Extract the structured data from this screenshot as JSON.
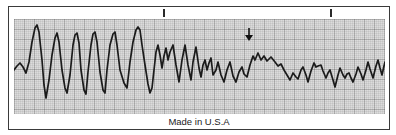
{
  "figure": {
    "type": "ecg-rhythm-strip",
    "caption": "Made in U.S.A",
    "colors": {
      "paper": "#ffffff",
      "frame_border": "#3a3a3a",
      "grid_bg": "#dcdcdc",
      "grid_minor": "rgba(0,0,0,0.06)",
      "grid_major": "rgba(0,0,0,0.16)",
      "trace": "#1b1b1b",
      "annotation": "#111111"
    }
  },
  "chart_data": {
    "type": "line",
    "title": "",
    "xlabel": "",
    "ylabel": "",
    "legend": false,
    "grid": true,
    "series_name": "ecg-trace",
    "grid_origin": [
      14,
      19
    ],
    "grid_size": [
      371,
      95
    ],
    "minor_cell_px": 2,
    "major_cell_px": 10,
    "points": [
      [
        14,
        70
      ],
      [
        17,
        66
      ],
      [
        20,
        63
      ],
      [
        23,
        67
      ],
      [
        26,
        73
      ],
      [
        29,
        62
      ],
      [
        32,
        42
      ],
      [
        35,
        28
      ],
      [
        37,
        25
      ],
      [
        39,
        32
      ],
      [
        42,
        60
      ],
      [
        44,
        85
      ],
      [
        46,
        98
      ],
      [
        49,
        80
      ],
      [
        52,
        55
      ],
      [
        55,
        38
      ],
      [
        57,
        33
      ],
      [
        59,
        42
      ],
      [
        62,
        70
      ],
      [
        65,
        88
      ],
      [
        67,
        93
      ],
      [
        70,
        75
      ],
      [
        73,
        45
      ],
      [
        75,
        35
      ],
      [
        77,
        33
      ],
      [
        79,
        43
      ],
      [
        81,
        70
      ],
      [
        84,
        90
      ],
      [
        86,
        94
      ],
      [
        88,
        72
      ],
      [
        91,
        45
      ],
      [
        93,
        34
      ],
      [
        95,
        32
      ],
      [
        97,
        42
      ],
      [
        100,
        72
      ],
      [
        103,
        90
      ],
      [
        105,
        93
      ],
      [
        107,
        70
      ],
      [
        110,
        45
      ],
      [
        113,
        34
      ],
      [
        115,
        32
      ],
      [
        117,
        45
      ],
      [
        120,
        70
      ],
      [
        124,
        83
      ],
      [
        127,
        88
      ],
      [
        130,
        62
      ],
      [
        133,
        42
      ],
      [
        136,
        30
      ],
      [
        138,
        27
      ],
      [
        140,
        30
      ],
      [
        142,
        45
      ],
      [
        145,
        65
      ],
      [
        148,
        84
      ],
      [
        150,
        93
      ],
      [
        152,
        88
      ],
      [
        154,
        70
      ],
      [
        156,
        52
      ],
      [
        158,
        45
      ],
      [
        160,
        55
      ],
      [
        162,
        68
      ],
      [
        164,
        56
      ],
      [
        166,
        48
      ],
      [
        168,
        60
      ],
      [
        170,
        52
      ],
      [
        173,
        45
      ],
      [
        176,
        65
      ],
      [
        179,
        82
      ],
      [
        182,
        60
      ],
      [
        185,
        45
      ],
      [
        188,
        65
      ],
      [
        191,
        80
      ],
      [
        193,
        62
      ],
      [
        196,
        47
      ],
      [
        199,
        68
      ],
      [
        201,
        77
      ],
      [
        203,
        65
      ],
      [
        205,
        60
      ],
      [
        207,
        70
      ],
      [
        209,
        63
      ],
      [
        211,
        58
      ],
      [
        213,
        75
      ],
      [
        216,
        70
      ],
      [
        218,
        62
      ],
      [
        221,
        75
      ],
      [
        224,
        82
      ],
      [
        227,
        70
      ],
      [
        230,
        62
      ],
      [
        233,
        76
      ],
      [
        236,
        82
      ],
      [
        239,
        72
      ],
      [
        242,
        67
      ],
      [
        244,
        74
      ],
      [
        247,
        77
      ],
      [
        250,
        65
      ],
      [
        253,
        56
      ],
      [
        255,
        60
      ],
      [
        258,
        53
      ],
      [
        261,
        60
      ],
      [
        264,
        56
      ],
      [
        267,
        61
      ],
      [
        271,
        57
      ],
      [
        275,
        62
      ],
      [
        278,
        66
      ],
      [
        281,
        64
      ],
      [
        284,
        70
      ],
      [
        287,
        75
      ],
      [
        290,
        80
      ],
      [
        293,
        73
      ],
      [
        296,
        77
      ],
      [
        298,
        79
      ],
      [
        301,
        70
      ],
      [
        303,
        67
      ],
      [
        306,
        75
      ],
      [
        308,
        82
      ],
      [
        311,
        71
      ],
      [
        314,
        63
      ],
      [
        316,
        67
      ],
      [
        318,
        66
      ],
      [
        321,
        65
      ],
      [
        323,
        71
      ],
      [
        326,
        78
      ],
      [
        328,
        73
      ],
      [
        330,
        70
      ],
      [
        333,
        80
      ],
      [
        335,
        87
      ],
      [
        338,
        75
      ],
      [
        340,
        68
      ],
      [
        343,
        75
      ],
      [
        345,
        78
      ],
      [
        347,
        74
      ],
      [
        349,
        73
      ],
      [
        351,
        78
      ],
      [
        353,
        82
      ],
      [
        356,
        74
      ],
      [
        358,
        67
      ],
      [
        361,
        74
      ],
      [
        363,
        80
      ],
      [
        366,
        70
      ],
      [
        368,
        62
      ],
      [
        370,
        69
      ],
      [
        373,
        78
      ],
      [
        376,
        66
      ],
      [
        378,
        60
      ],
      [
        380,
        68
      ],
      [
        382,
        75
      ],
      [
        384,
        66
      ],
      [
        385,
        62
      ]
    ],
    "annotations": {
      "down_arrow": {
        "x": 249,
        "stem_top_y": 28,
        "tip_y": 41,
        "half_width": 4
      },
      "top_interval_ticks": {
        "xs": [
          163,
          330
        ],
        "y1": 9,
        "y2": 17
      }
    }
  }
}
